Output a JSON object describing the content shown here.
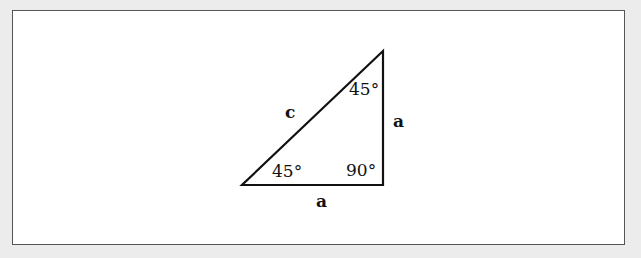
{
  "diagram": {
    "colors": {
      "background": "#ececec",
      "panel": "#ffffff",
      "border": "#555555",
      "stroke": "#111111"
    },
    "vertices": {
      "bottom_left": [
        242,
        185
      ],
      "bottom_right": [
        383,
        185
      ],
      "top": [
        383,
        51
      ]
    },
    "labels": {
      "hypotenuse": "c",
      "vertical_leg": "a",
      "horizontal_leg": "a",
      "angle_bottom_left": "45°",
      "angle_top": "45°",
      "angle_right": "90°"
    }
  }
}
